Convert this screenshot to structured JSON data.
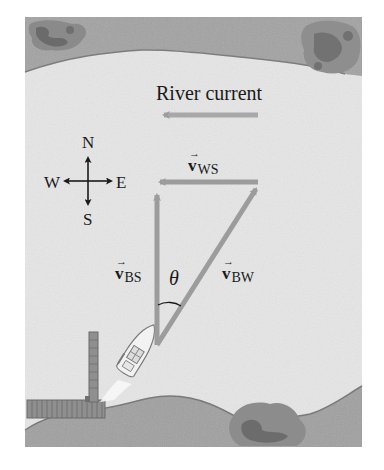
{
  "diagram": {
    "type": "physics vector diagram",
    "title": "River current",
    "compass": {
      "north": "N",
      "south": "S",
      "east": "E",
      "west": "W"
    },
    "vectors": [
      {
        "id": "v_WS",
        "symbol": "v",
        "subscript": "WS",
        "meaning": "water relative to shore",
        "direction": "west"
      },
      {
        "id": "v_BS",
        "symbol": "v",
        "subscript": "BS",
        "meaning": "boat relative to shore",
        "direction": "north"
      },
      {
        "id": "v_BW",
        "symbol": "v",
        "subscript": "BW",
        "meaning": "boat relative to water",
        "direction": "north-east"
      }
    ],
    "angle_label": "θ",
    "vector_arrow_glyph": "→",
    "elements": [
      "top river bank with bushes",
      "bottom river bank with bush",
      "dock with pier",
      "motor boat with wake"
    ],
    "colors": {
      "bank": "#9a9a9a",
      "bank_dark": "#6f6f6f",
      "water": "#e6e6e6",
      "vector": "#9c9c9c",
      "text": "#1a1a1a"
    }
  }
}
